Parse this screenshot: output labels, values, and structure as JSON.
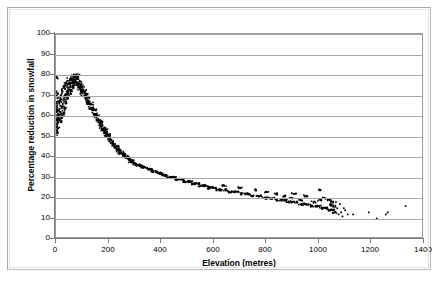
{
  "chart_data": {
    "type": "scatter",
    "title": "",
    "xlabel": "Elevation (metres)",
    "ylabel": "Percentage reduction in snowfall",
    "xlim": [
      0,
      1400
    ],
    "ylim": [
      0,
      100
    ],
    "xticks": [
      0,
      200,
      400,
      600,
      800,
      1000,
      1200,
      1400
    ],
    "yticks": [
      0,
      10,
      20,
      30,
      40,
      50,
      60,
      70,
      80,
      90,
      100
    ],
    "grid": "horizontal",
    "legend": "none",
    "marker": "small-black-square",
    "marker_color": "#000000",
    "points": [
      [
        2,
        79
      ],
      [
        2,
        72
      ],
      [
        3,
        70
      ],
      [
        3,
        66
      ],
      [
        3,
        62
      ],
      [
        4,
        58
      ],
      [
        4,
        55
      ],
      [
        4,
        52
      ],
      [
        5,
        60
      ],
      [
        6,
        64
      ],
      [
        7,
        57
      ],
      [
        8,
        61
      ],
      [
        9,
        54
      ],
      [
        10,
        63
      ],
      [
        12,
        58
      ],
      [
        13,
        66
      ],
      [
        14,
        60
      ],
      [
        16,
        68
      ],
      [
        17,
        62
      ],
      [
        18,
        57
      ],
      [
        20,
        70
      ],
      [
        21,
        64
      ],
      [
        23,
        59
      ],
      [
        25,
        72
      ],
      [
        26,
        66
      ],
      [
        28,
        61
      ],
      [
        30,
        74
      ],
      [
        32,
        68
      ],
      [
        33,
        63
      ],
      [
        35,
        70
      ],
      [
        37,
        75
      ],
      [
        38,
        66
      ],
      [
        40,
        72
      ],
      [
        42,
        77
      ],
      [
        44,
        69
      ],
      [
        45,
        74
      ],
      [
        47,
        71
      ],
      [
        49,
        76
      ],
      [
        51,
        73
      ],
      [
        53,
        78
      ],
      [
        55,
        74
      ],
      [
        57,
        76
      ],
      [
        59,
        72
      ],
      [
        61,
        78
      ],
      [
        63,
        75
      ],
      [
        65,
        79
      ],
      [
        67,
        76
      ],
      [
        69,
        78
      ],
      [
        71,
        75
      ],
      [
        73,
        79
      ],
      [
        75,
        77
      ],
      [
        77,
        80
      ],
      [
        79,
        76
      ],
      [
        81,
        78
      ],
      [
        83,
        75
      ],
      [
        85,
        79
      ],
      [
        87,
        76
      ],
      [
        89,
        74
      ],
      [
        91,
        77
      ],
      [
        93,
        73
      ],
      [
        95,
        75
      ],
      [
        97,
        72
      ],
      [
        99,
        74
      ],
      [
        101,
        71
      ],
      [
        104,
        73
      ],
      [
        107,
        70
      ],
      [
        110,
        72
      ],
      [
        113,
        68
      ],
      [
        116,
        70
      ],
      [
        119,
        67
      ],
      [
        122,
        69
      ],
      [
        125,
        66
      ],
      [
        128,
        67
      ],
      [
        131,
        64
      ],
      [
        134,
        66
      ],
      [
        137,
        63
      ],
      [
        140,
        64
      ],
      [
        143,
        61
      ],
      [
        146,
        63
      ],
      [
        149,
        60
      ],
      [
        152,
        61
      ],
      [
        155,
        58
      ],
      [
        158,
        60
      ],
      [
        161,
        57
      ],
      [
        164,
        58
      ],
      [
        167,
        56
      ],
      [
        170,
        57
      ],
      [
        173,
        54
      ],
      [
        176,
        55
      ],
      [
        179,
        53
      ],
      [
        182,
        54
      ],
      [
        185,
        52
      ],
      [
        188,
        53
      ],
      [
        191,
        51
      ],
      [
        194,
        52
      ],
      [
        197,
        50
      ],
      [
        200,
        51
      ],
      [
        205,
        49
      ],
      [
        210,
        48
      ],
      [
        215,
        47
      ],
      [
        220,
        46
      ],
      [
        225,
        45
      ],
      [
        230,
        45
      ],
      [
        235,
        44
      ],
      [
        240,
        43
      ],
      [
        245,
        42
      ],
      [
        250,
        42
      ],
      [
        255,
        41
      ],
      [
        260,
        41
      ],
      [
        265,
        40
      ],
      [
        270,
        40
      ],
      [
        275,
        39
      ],
      [
        280,
        39
      ],
      [
        285,
        38
      ],
      [
        290,
        38
      ],
      [
        295,
        37
      ],
      [
        300,
        37
      ],
      [
        310,
        36
      ],
      [
        320,
        36
      ],
      [
        330,
        35
      ],
      [
        340,
        35
      ],
      [
        350,
        34
      ],
      [
        360,
        34
      ],
      [
        370,
        33
      ],
      [
        380,
        33
      ],
      [
        390,
        32
      ],
      [
        400,
        32
      ],
      [
        410,
        31
      ],
      [
        420,
        31
      ],
      [
        430,
        30
      ],
      [
        440,
        30
      ],
      [
        450,
        30
      ],
      [
        460,
        29
      ],
      [
        470,
        29
      ],
      [
        480,
        29
      ],
      [
        490,
        28
      ],
      [
        500,
        28
      ],
      [
        510,
        28
      ],
      [
        520,
        27
      ],
      [
        530,
        27
      ],
      [
        540,
        27
      ],
      [
        550,
        26
      ],
      [
        560,
        26
      ],
      [
        570,
        26
      ],
      [
        580,
        25
      ],
      [
        590,
        25
      ],
      [
        600,
        25
      ],
      [
        615,
        24
      ],
      [
        630,
        24
      ],
      [
        645,
        24
      ],
      [
        660,
        23
      ],
      [
        675,
        23
      ],
      [
        690,
        23
      ],
      [
        705,
        22
      ],
      [
        720,
        22
      ],
      [
        735,
        22
      ],
      [
        750,
        21
      ],
      [
        765,
        21
      ],
      [
        780,
        21
      ],
      [
        795,
        20
      ],
      [
        810,
        20
      ],
      [
        825,
        20
      ],
      [
        840,
        19
      ],
      [
        855,
        19
      ],
      [
        870,
        19
      ],
      [
        885,
        18
      ],
      [
        900,
        18
      ],
      [
        915,
        18
      ],
      [
        930,
        17
      ],
      [
        945,
        17
      ],
      [
        960,
        17
      ],
      [
        975,
        16
      ],
      [
        990,
        16
      ],
      [
        1000,
        16
      ],
      [
        1010,
        15
      ],
      [
        1020,
        15
      ],
      [
        1030,
        15
      ],
      [
        1040,
        14
      ],
      [
        1050,
        14
      ],
      [
        1000,
        24
      ],
      [
        1020,
        20
      ],
      [
        1040,
        19
      ],
      [
        1050,
        18
      ],
      [
        1055,
        16
      ],
      [
        1060,
        13
      ],
      [
        1070,
        15
      ],
      [
        1075,
        12
      ],
      [
        1080,
        17
      ],
      [
        1085,
        13
      ],
      [
        1090,
        11
      ],
      [
        1100,
        14
      ],
      [
        1110,
        12
      ],
      [
        1130,
        12
      ],
      [
        1190,
        13
      ],
      [
        1220,
        10
      ],
      [
        1255,
        12
      ],
      [
        1262,
        13
      ],
      [
        1330,
        16
      ],
      [
        950,
        21
      ],
      [
        905,
        22
      ],
      [
        870,
        21
      ],
      [
        840,
        22
      ],
      [
        800,
        23
      ],
      [
        760,
        24
      ],
      [
        700,
        25
      ],
      [
        640,
        26
      ],
      [
        1005,
        19
      ],
      [
        980,
        18
      ],
      [
        930,
        19
      ],
      [
        895,
        20
      ],
      [
        1045,
        17
      ],
      [
        1065,
        18
      ],
      [
        1095,
        15
      ]
    ]
  }
}
